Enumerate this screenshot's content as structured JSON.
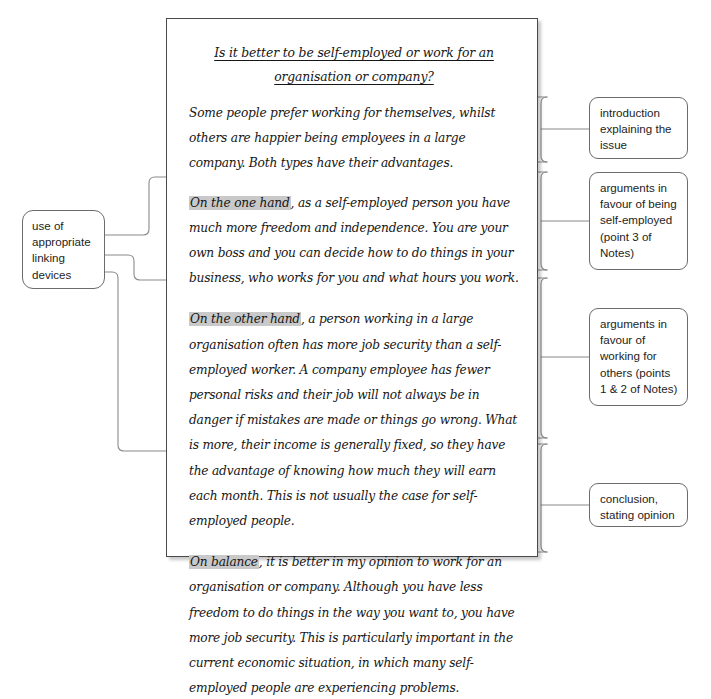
{
  "diagram": {
    "kind": "annotated-essay-model",
    "essay": {
      "title": "Is it better to be self-employed or work for an organisation or company?",
      "paragraphs": [
        {
          "id": "introduction",
          "linker": "",
          "text": "Some people prefer working for themselves, whilst others are happier being employees in a large company. Both types have their advantages."
        },
        {
          "id": "body-one",
          "linker": "On the one hand",
          "text": ", as a self-employed person you have much more freedom and independence. You are your own boss and you can decide how to do things in your business, who works for you and what hours you work."
        },
        {
          "id": "body-two",
          "linker": "On the other hand",
          "text": ", a person working in a large organisation often has more job security than a self-employed worker. A company employee has fewer personal risks and their job will not always be in danger if mistakes are made or things go wrong. What is more, their income is generally fixed, so they have the advantage of knowing how much they will earn each month. This is not usually the case for self-employed people."
        },
        {
          "id": "conclusion",
          "linker": "On balance",
          "text": ", it is better in my opinion to work for an organisation or company. Although you have less freedom to do things in the way you want to, you have more job security. This is particularly important in the current economic situation, in which many self-employed people are experiencing problems."
        }
      ]
    },
    "left_annotation": {
      "label": "use of appropriate linking devices"
    },
    "right_annotations": [
      {
        "id": "introduction",
        "label": "introduction explaining the issue"
      },
      {
        "id": "self-employed",
        "label": "arguments in favour of being self-employed (point 3 of Notes)"
      },
      {
        "id": "others",
        "label": "arguments in favour of working for others (points 1 & 2 of Notes)"
      },
      {
        "id": "conclusion",
        "label": "conclusion, stating opinion"
      }
    ],
    "colors": {
      "page_background": "#ffffff",
      "essay_border": "#4a4a4a",
      "annotation_border": "#6c6c6c",
      "connector": "#8a8a8a",
      "highlight": "#c9c9c9",
      "text": "#161616"
    }
  }
}
